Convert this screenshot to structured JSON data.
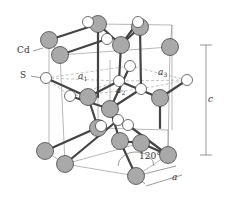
{
  "diagram": {
    "labels": {
      "cd": "Cd",
      "s": "S",
      "a1": "a",
      "a1_sub": "1",
      "a2": "a",
      "a2_sub": "2",
      "a3": "a",
      "a3_sub": "3",
      "c": "c",
      "a": "a",
      "angle": "120°"
    },
    "colors": {
      "cd_fill": "#a9a9a9",
      "s_fill": "#ffffff",
      "stroke": "#333333",
      "bond": "#444444",
      "cell": "#888888",
      "dashed": "#999999"
    },
    "atoms": {
      "cd": [
        [
          49,
          40
        ],
        [
          98,
          24
        ],
        [
          60,
          55
        ],
        [
          121,
          45
        ],
        [
          140,
          27
        ],
        [
          170,
          47
        ],
        [
          88,
          97
        ],
        [
          110,
          109
        ],
        [
          160,
          98
        ],
        [
          98,
          128
        ],
        [
          120,
          141
        ],
        [
          45,
          151
        ],
        [
          65,
          164
        ],
        [
          141,
          143
        ],
        [
          168,
          155
        ],
        [
          136,
          176
        ]
      ],
      "s": [
        [
          88,
          22
        ],
        [
          138,
          22
        ],
        [
          107,
          39
        ],
        [
          130,
          66
        ],
        [
          46,
          78
        ],
        [
          119,
          81
        ],
        [
          70,
          96
        ],
        [
          141,
          89
        ],
        [
          187,
          80
        ],
        [
          118,
          120
        ],
        [
          101,
          126
        ],
        [
          128,
          125
        ]
      ]
    }
  }
}
